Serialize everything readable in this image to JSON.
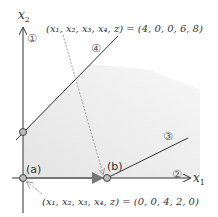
{
  "axes": {
    "x_label": "x",
    "x_sub": "1",
    "y_label": "x",
    "y_sub": "2"
  },
  "constraints": [
    {
      "id": "1",
      "label": "①"
    },
    {
      "id": "2",
      "label": "②"
    },
    {
      "id": "3",
      "label": "③"
    },
    {
      "id": "4",
      "label": "④"
    }
  ],
  "points": {
    "a": {
      "label": "(a)"
    },
    "b": {
      "label": "(b)"
    }
  },
  "annotations": {
    "top": "(x₁, x₂, x₃, x₄, z) = (4, 0, 0, 6, 8)",
    "bottom": "(x₁, x₂, x₃, x₄, z) = (0, 0, 4, 2, 0)"
  },
  "colors": {
    "axis": "#333333",
    "line": "#333333",
    "region": "#e9e9e9",
    "point_fill": "#bdbdbd",
    "move_arrow": "#777777",
    "dashed": "#888888"
  }
}
